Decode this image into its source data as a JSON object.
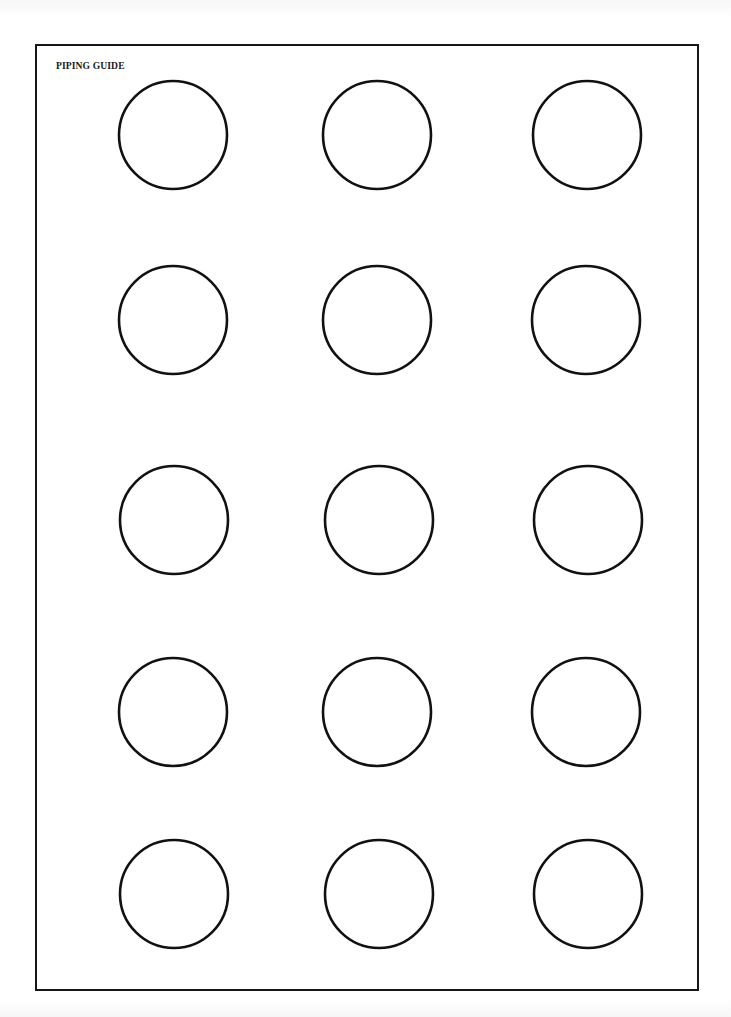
{
  "document": {
    "title": "PIPING GUIDE",
    "stroke_color": "#111111",
    "background": "#ffffff"
  },
  "grid": {
    "rows": 5,
    "columns": 3,
    "circle_radius": 54,
    "circles": [
      {
        "row": 1,
        "col": 1,
        "cx": 173,
        "cy": 135
      },
      {
        "row": 1,
        "col": 2,
        "cx": 377,
        "cy": 135
      },
      {
        "row": 1,
        "col": 3,
        "cx": 587,
        "cy": 135
      },
      {
        "row": 2,
        "col": 1,
        "cx": 173,
        "cy": 320
      },
      {
        "row": 2,
        "col": 2,
        "cx": 377,
        "cy": 320
      },
      {
        "row": 2,
        "col": 3,
        "cx": 586,
        "cy": 320
      },
      {
        "row": 3,
        "col": 1,
        "cx": 174,
        "cy": 520
      },
      {
        "row": 3,
        "col": 2,
        "cx": 379,
        "cy": 520
      },
      {
        "row": 3,
        "col": 3,
        "cx": 588,
        "cy": 520
      },
      {
        "row": 4,
        "col": 1,
        "cx": 173,
        "cy": 712
      },
      {
        "row": 4,
        "col": 2,
        "cx": 377,
        "cy": 712
      },
      {
        "row": 4,
        "col": 3,
        "cx": 586,
        "cy": 712
      },
      {
        "row": 5,
        "col": 1,
        "cx": 174,
        "cy": 894
      },
      {
        "row": 5,
        "col": 2,
        "cx": 379,
        "cy": 894
      },
      {
        "row": 5,
        "col": 3,
        "cx": 588,
        "cy": 894
      }
    ]
  }
}
